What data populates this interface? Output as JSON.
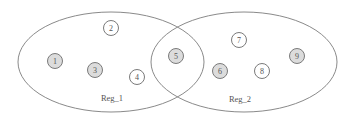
{
  "regions": [
    {
      "id": "reg_1",
      "label": "Reg_1",
      "cx": 111,
      "cy": 62,
      "rx": 93,
      "ry": 50,
      "label_x": 112,
      "label_y": 101
    },
    {
      "id": "reg_2",
      "label": "Reg_2",
      "cx": 244,
      "cy": 62,
      "rx": 93,
      "ry": 50,
      "label_x": 240,
      "label_y": 102
    }
  ],
  "nodes": [
    {
      "label": "1",
      "x": 55,
      "y": 61,
      "filled": true,
      "regions": [
        "Reg_1"
      ]
    },
    {
      "label": "2",
      "x": 111,
      "y": 28,
      "filled": false,
      "regions": [
        "Reg_1"
      ]
    },
    {
      "label": "3",
      "x": 95,
      "y": 70,
      "filled": true,
      "regions": [
        "Reg_1"
      ]
    },
    {
      "label": "4",
      "x": 137,
      "y": 77,
      "filled": false,
      "regions": [
        "Reg_1"
      ]
    },
    {
      "label": "5",
      "x": 176,
      "y": 56,
      "filled": true,
      "regions": [
        "Reg_1",
        "Reg_2"
      ]
    },
    {
      "label": "6",
      "x": 220,
      "y": 71,
      "filled": true,
      "regions": [
        "Reg_2"
      ]
    },
    {
      "label": "7",
      "x": 239,
      "y": 40,
      "filled": false,
      "regions": [
        "Reg_2"
      ]
    },
    {
      "label": "8",
      "x": 262,
      "y": 71,
      "filled": false,
      "regions": [
        "Reg_2"
      ]
    },
    {
      "label": "9",
      "x": 297,
      "y": 56,
      "filled": true,
      "regions": [
        "Reg_2"
      ]
    }
  ],
  "style": {
    "filled_color": "#dcdcdc",
    "empty_color": "#ffffff",
    "node_radius": 7.5
  }
}
